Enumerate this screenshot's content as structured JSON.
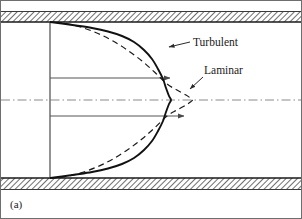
{
  "figure": {
    "caption": "(a)",
    "background_color": "#ffffff",
    "frame_color": "#4a4a4a",
    "wall_hatch_color": "#555555",
    "curve_color": "#111111",
    "centerline_color": "#7a7a7a",
    "arrow_color": "#555555"
  },
  "labels": {
    "turbulent": "Turbulent",
    "laminar": "Laminar"
  },
  "chart_data": {
    "type": "line",
    "title": "",
    "subtitle": "",
    "xlabel": "",
    "ylabel": "",
    "grid": false,
    "legend_position": "inline-annotations",
    "annotations": [
      {
        "text": "Turbulent",
        "x": 196,
        "y": 42,
        "points_to_x": 168,
        "points_to_y": 48
      },
      {
        "text": "Laminar",
        "x": 205,
        "y": 72,
        "points_to_x": 191,
        "points_to_y": 88
      },
      {
        "text": "(a)",
        "x": 10,
        "y": 206
      }
    ],
    "geometry": {
      "pipe_top_wall_y": 22,
      "pipe_bottom_wall_y": 178,
      "centerline_y": 100,
      "inlet_line_x": 50,
      "turbulent_peak_x": 172,
      "laminar_peak_x": 193
    },
    "series": [
      {
        "name": "Turbulent",
        "style": "solid",
        "points": [
          [
            50,
            178
          ],
          [
            62,
            176.5
          ],
          [
            76,
            174.5
          ],
          [
            92,
            172
          ],
          [
            108,
            168.5
          ],
          [
            122,
            164
          ],
          [
            134,
            158
          ],
          [
            144,
            150
          ],
          [
            152,
            141
          ],
          [
            158,
            131
          ],
          [
            163,
            121
          ],
          [
            166,
            112
          ],
          [
            169,
            104
          ],
          [
            171,
            100
          ],
          [
            169,
            96
          ],
          [
            166,
            88
          ],
          [
            163,
            79
          ],
          [
            158,
            69
          ],
          [
            152,
            59
          ],
          [
            144,
            50
          ],
          [
            134,
            42
          ],
          [
            122,
            36
          ],
          [
            108,
            31.5
          ],
          [
            92,
            28
          ],
          [
            76,
            25.5
          ],
          [
            62,
            23.5
          ],
          [
            50,
            22
          ]
        ]
      },
      {
        "name": "Laminar",
        "style": "dashed",
        "points": [
          [
            50,
            178
          ],
          [
            66,
            176.5
          ],
          [
            82,
            172.5
          ],
          [
            98,
            166.5
          ],
          [
            113,
            159
          ],
          [
            128,
            149.5
          ],
          [
            142,
            139
          ],
          [
            155,
            127.5
          ],
          [
            167,
            116
          ],
          [
            177,
            110
          ],
          [
            186,
            105
          ],
          [
            191,
            101.5
          ],
          [
            192.5,
            100
          ],
          [
            191,
            98.5
          ],
          [
            186,
            95
          ],
          [
            177,
            90
          ],
          [
            167,
            84
          ],
          [
            155,
            72.5
          ],
          [
            142,
            61
          ],
          [
            128,
            50.5
          ],
          [
            113,
            41
          ],
          [
            98,
            33.5
          ],
          [
            82,
            27.5
          ],
          [
            66,
            23.5
          ],
          [
            50,
            22
          ]
        ]
      }
    ],
    "velocity_arrows": [
      {
        "y": 78,
        "from_x": 50,
        "to_x": 172
      },
      {
        "y": 116,
        "from_x": 50,
        "to_x": 186
      }
    ]
  }
}
